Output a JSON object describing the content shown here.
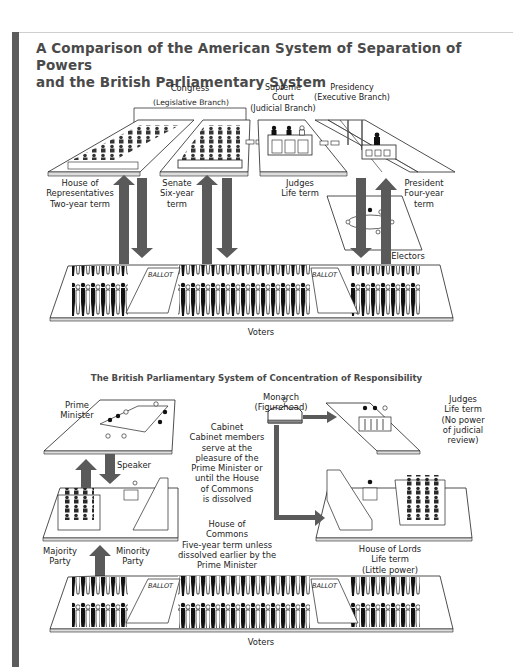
{
  "title": {
    "line1": "A Comparison of the American System of Separation of Powers",
    "line2": "and the British Parliamentary System"
  },
  "american": {
    "congress": "Congress",
    "legislative": "(Legislative Branch)",
    "supreme_court": "Supreme\nCourt\n(Judicial Branch)",
    "presidency": "Presidency\n(Executive Branch)",
    "house": "House of\nRepresentatives\nTwo-year term",
    "senate": "Senate\nSix-year\nterm",
    "judges": "Judges\nLife term",
    "president": "President\nFour-year\nterm",
    "electors": "Electors",
    "voters": "Voters",
    "ballot": "BALLOT"
  },
  "british": {
    "subtitle": "The British Parliamentary System of Concentration of Responsibility",
    "prime_minister": "Prime\nMinister",
    "monarch": "Monarch\n(Figurehead)",
    "judges": "Judges\nLife term\n(No power\nof judicial\nreview)",
    "cabinet": "Cabinet\nCabinet members\nserve at the\npleasure of the\nPrime Minister or\nuntil the House\nof Commons\nis dissolved",
    "speaker": "Speaker",
    "commons": "House of\nCommons\nFive-year term unless\ndissolved earlier by the\nPrime Minister",
    "majority": "Majority\nParty",
    "minority": "Minority\nParty",
    "lords": "House of Lords\nLife term\n(Little power)",
    "voters": "Voters",
    "ballot": "BALLOT"
  },
  "colors": {
    "arrow": "#5a5a5a",
    "sidebar": "#5c5c5c",
    "title": "#4a4a4a"
  }
}
